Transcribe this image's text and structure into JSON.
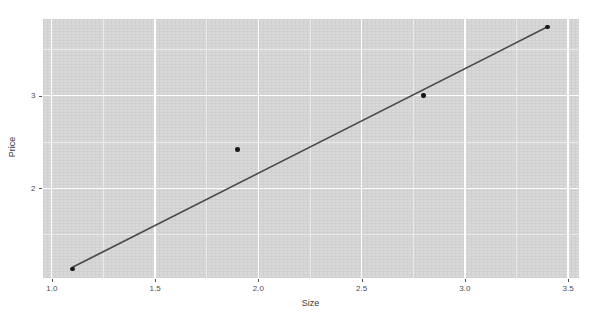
{
  "chart_data": {
    "type": "scatter",
    "title": "",
    "subtitle": "",
    "xlabel": "Size",
    "ylabel": "Price",
    "xlim": [
      0.955,
      3.55
    ],
    "ylim": [
      1.04,
      3.83
    ],
    "xticks": [
      1.0,
      1.5,
      2.0,
      2.5,
      3.0,
      3.5
    ],
    "xticklabels": [
      "1.0",
      "1.5",
      "2.0",
      "2.5",
      "3.0",
      "3.5"
    ],
    "yticks": [
      2,
      3
    ],
    "yticklabels": [
      "2",
      "3"
    ],
    "x_minor_ticks": [
      1.25,
      1.75,
      2.25,
      2.75,
      3.25
    ],
    "y_minor_ticks": [
      1.5,
      2.5,
      3.5
    ],
    "grid": true,
    "legend": false,
    "legend_position": "none",
    "panel_background": "#d9d9d9",
    "grid_color": "#ffffff",
    "minor_grid_color": "#eaeaea",
    "point_color": "#1a1a1a",
    "line_color": "#4a4a4a",
    "series": [
      {
        "name": "observations",
        "type": "scatter",
        "x": [
          1.1,
          1.9,
          2.8,
          3.4
        ],
        "y": [
          1.13,
          2.42,
          3.0,
          3.74
        ]
      },
      {
        "name": "fitted-line",
        "type": "line",
        "x": [
          1.1,
          3.4
        ],
        "y": [
          1.15,
          3.74
        ]
      }
    ]
  },
  "axes": {
    "x": {
      "title": "Size",
      "labels": [
        "1.0",
        "1.5",
        "2.0",
        "2.5",
        "3.0",
        "3.5"
      ]
    },
    "y": {
      "title": "Price",
      "labels": [
        "2",
        "3"
      ]
    }
  }
}
